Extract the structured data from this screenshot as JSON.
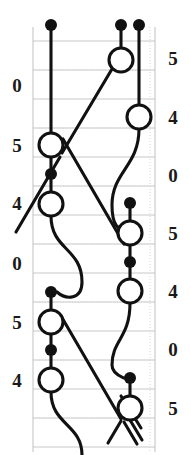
{
  "figure": {
    "kind": "braid-knot-diagram",
    "width": 191,
    "height": 455,
    "background_color": "#ffffff",
    "stroke_color": "#111111",
    "grid_color": "#c8c8c8",
    "grid_dotted_color": "#d8d8d8",
    "frame": {
      "left": 33,
      "right": 155,
      "top": 27,
      "bottom": 452
    }
  },
  "chart_data": {
    "type": "scatter",
    "title": "",
    "xlabel": "",
    "ylabel": "",
    "grid": true,
    "legend": null,
    "axis_ranges": {
      "x": [
        33,
        155
      ],
      "y": [
        27,
        452
      ]
    },
    "left_axis": {
      "position": "left",
      "tick_labels": [
        "0",
        "5",
        "4",
        "0",
        "5",
        "4"
      ],
      "tick_y": [
        85,
        145,
        203,
        263,
        322,
        380
      ]
    },
    "right_axis": {
      "position": "right",
      "tick_labels": [
        "5",
        "4",
        "0",
        "5",
        "4",
        "0",
        "5"
      ],
      "tick_y": [
        58,
        117,
        175,
        233,
        291,
        349,
        408
      ]
    },
    "gridlines_y": [
      41,
      70,
      99,
      128,
      157,
      186,
      215,
      244,
      273,
      302,
      331,
      360,
      389,
      418,
      447
    ],
    "gridlines_dotted_y": [
      70,
      128,
      186,
      244,
      302,
      360,
      418
    ],
    "column_x": [
      51,
      103,
      121,
      139
    ],
    "open_circles": [
      {
        "cx": 121,
        "cy": 60,
        "r": 12
      },
      {
        "cx": 139,
        "cy": 117,
        "r": 12
      },
      {
        "cx": 51,
        "cy": 145,
        "r": 12
      },
      {
        "cx": 51,
        "cy": 204,
        "r": 12
      },
      {
        "cx": 130,
        "cy": 233,
        "r": 12
      },
      {
        "cx": 130,
        "cy": 291,
        "r": 12
      },
      {
        "cx": 51,
        "cy": 322,
        "r": 12
      },
      {
        "cx": 51,
        "cy": 380,
        "r": 12
      },
      {
        "cx": 130,
        "cy": 408,
        "r": 12
      }
    ],
    "filled_dots": [
      {
        "cx": 51,
        "cy": 25,
        "r": 6
      },
      {
        "cx": 121,
        "cy": 25,
        "r": 6
      },
      {
        "cx": 139,
        "cy": 25,
        "r": 6
      },
      {
        "cx": 51,
        "cy": 174,
        "r": 6
      },
      {
        "cx": 130,
        "cy": 203,
        "r": 6
      },
      {
        "cx": 51,
        "cy": 292,
        "r": 6
      },
      {
        "cx": 130,
        "cy": 262,
        "r": 6
      },
      {
        "cx": 51,
        "cy": 350,
        "r": 6
      },
      {
        "cx": 130,
        "cy": 378,
        "r": 6
      }
    ],
    "strand_count": 4,
    "crossings": 6
  }
}
